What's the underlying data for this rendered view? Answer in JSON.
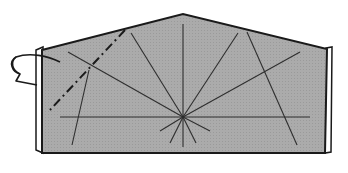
{
  "diagram": {
    "type": "origami-step",
    "colors": {
      "paper": "#a9a9a9",
      "outline": "#1a1a1a",
      "crease": "#2e2e2e",
      "edge_highlight": "#ffffff",
      "background": "#ffffff"
    },
    "shape": {
      "outline_points": [
        [
          37,
          48
        ],
        [
          183,
          13
        ],
        [
          331,
          47
        ],
        [
          329,
          153
        ],
        [
          42,
          153
        ]
      ],
      "peak": [
        183,
        13
      ],
      "center": [
        183,
        117
      ]
    },
    "creases": {
      "horizontal": {
        "from": [
          60,
          117
        ],
        "to": [
          310,
          117
        ]
      },
      "radial": [
        {
          "to": [
            68,
            52
          ]
        },
        {
          "to": [
            131,
            33
          ]
        },
        {
          "to": [
            183,
            24
          ]
        },
        {
          "to": [
            238,
            33
          ]
        },
        {
          "to": [
            300,
            52
          ]
        },
        {
          "to": [
            160,
            130
          ]
        },
        {
          "to": [
            170,
            142
          ]
        },
        {
          "to": [
            183,
            146
          ]
        },
        {
          "to": [
            196,
            142
          ]
        },
        {
          "to": [
            210,
            130
          ]
        }
      ],
      "extra": [
        {
          "from": [
            88,
            70
          ],
          "to": [
            72,
            145
          ]
        },
        {
          "from": [
            246,
            32
          ],
          "to": [
            297,
            145
          ]
        }
      ]
    },
    "fold_line": {
      "style": "dash-dot",
      "from": [
        125,
        30
      ],
      "to": [
        50,
        110
      ]
    },
    "arrow": {
      "kind": "fold-behind",
      "position": "left-edge"
    }
  }
}
